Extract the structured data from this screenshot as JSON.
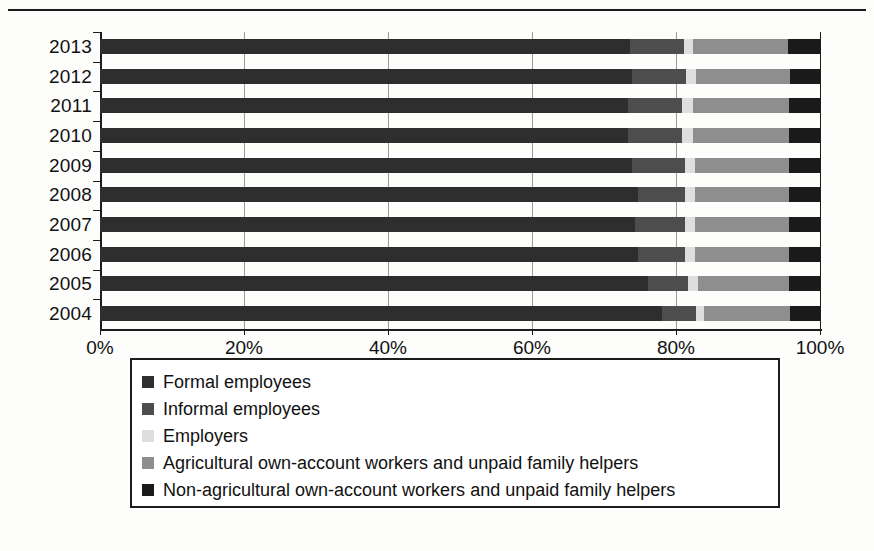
{
  "chart_data": {
    "type": "bar",
    "subtype": "stacked-horizontal-100pct",
    "title": "",
    "xlabel": "",
    "ylabel": "",
    "xlim": [
      0,
      100
    ],
    "x_ticks": [
      "0%",
      "20%",
      "40%",
      "60%",
      "80%",
      "100%"
    ],
    "x_tick_values": [
      0,
      20,
      40,
      60,
      80,
      100
    ],
    "grid": true,
    "grid_axis": "x",
    "legend_position": "bottom",
    "categories": [
      "2013",
      "2012",
      "2011",
      "2010",
      "2009",
      "2008",
      "2007",
      "2006",
      "2005",
      "2004"
    ],
    "series": [
      {
        "name": "Formal employees",
        "color": "#2e2e2e",
        "values": [
          73.6,
          73.9,
          73.3,
          73.3,
          73.9,
          74.7,
          74.3,
          74.7,
          76.1,
          78.1
        ]
      },
      {
        "name": "Informal employees",
        "color": "#4d4d4d",
        "values": [
          7.5,
          7.5,
          7.5,
          7.6,
          7.3,
          6.5,
          6.9,
          6.6,
          5.6,
          4.7
        ]
      },
      {
        "name": "Employers",
        "color": "#dedede",
        "values": [
          1.3,
          1.4,
          1.6,
          1.5,
          1.4,
          1.4,
          1.4,
          1.3,
          1.4,
          1.1
        ]
      },
      {
        "name": "Agricultural own-account workers and unpaid family helpers",
        "color": "#8e8e8e",
        "values": [
          13.2,
          13.0,
          13.3,
          13.3,
          13.1,
          13.1,
          13.1,
          13.1,
          12.6,
          12.0
        ]
      },
      {
        "name": "Non-agricultural own-account workers and unpaid family helpers",
        "color": "#1a1a1a",
        "values": [
          4.4,
          4.2,
          4.3,
          4.3,
          4.3,
          4.3,
          4.3,
          4.3,
          4.3,
          4.1
        ]
      }
    ]
  },
  "legend": {
    "items": [
      {
        "label": "Formal employees",
        "color": "#2e2e2e"
      },
      {
        "label": "Informal employees",
        "color": "#4d4d4d"
      },
      {
        "label": "Employers",
        "color": "#dedede"
      },
      {
        "label": "Agricultural own-account workers and unpaid family helpers",
        "color": "#8e8e8e"
      },
      {
        "label": "Non-agricultural own-account workers and unpaid family helpers",
        "color": "#1a1a1a"
      }
    ]
  }
}
